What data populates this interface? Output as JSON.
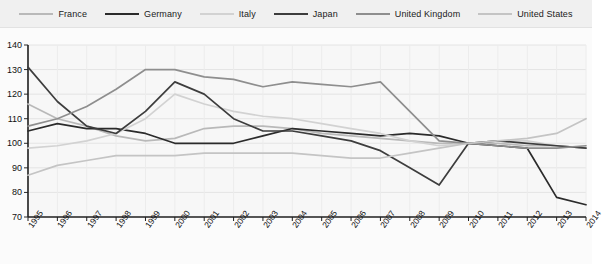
{
  "legend": {
    "position": "top",
    "items": [
      {
        "label": "France",
        "color": "#b9b9b9"
      },
      {
        "label": "Germany",
        "color": "#2b2b2b"
      },
      {
        "label": "Italy",
        "color": "#d2d2d2"
      },
      {
        "label": "Japan",
        "color": "#3d3d3d"
      },
      {
        "label": "United Kingdom",
        "color": "#8e8e8e"
      },
      {
        "label": "United States",
        "color": "#c4c4c4"
      }
    ]
  },
  "axes": {
    "y_ticks": [
      140,
      130,
      120,
      110,
      100,
      90,
      80,
      70
    ],
    "ylim": [
      70,
      140
    ],
    "xlim_labels": [
      "1995",
      "2014"
    ],
    "grid": true
  },
  "source_note": "",
  "chart_data": {
    "type": "line",
    "title": "",
    "subtitle": "",
    "xlabel": "",
    "ylabel": "",
    "ylim": [
      70,
      140
    ],
    "grid": true,
    "legend_position": "top",
    "categories": [
      "1995",
      "1996",
      "1997",
      "1998",
      "1999",
      "2000",
      "2001",
      "2002",
      "2003",
      "2004",
      "2005",
      "2006",
      "2007",
      "2008",
      "2009",
      "2010",
      "2011",
      "2012",
      "2013",
      "2014"
    ],
    "series": [
      {
        "name": "France",
        "color": "#b9b9b9",
        "values": [
          116,
          110,
          107,
          103,
          101,
          102,
          106,
          107,
          107,
          106,
          104,
          103,
          102,
          101,
          100,
          100,
          100,
          99,
          99,
          98
        ]
      },
      {
        "name": "Germany",
        "color": "#2b2b2b",
        "values": [
          105,
          108,
          106,
          106,
          104,
          100,
          100,
          100,
          103,
          106,
          105,
          104,
          103,
          104,
          103,
          100,
          99,
          98,
          78,
          75
        ]
      },
      {
        "name": "Italy",
        "color": "#d2d2d2",
        "values": [
          98,
          99,
          101,
          104,
          110,
          120,
          116,
          113,
          111,
          110,
          108,
          106,
          104,
          101,
          99,
          100,
          101,
          101,
          99,
          98
        ]
      },
      {
        "name": "Japan",
        "color": "#3d3d3d",
        "values": [
          131,
          117,
          107,
          104,
          113,
          125,
          120,
          110,
          105,
          105,
          103,
          101,
          97,
          90,
          83,
          100,
          101,
          100,
          99,
          98
        ]
      },
      {
        "name": "United Kingdom",
        "color": "#8e8e8e",
        "values": [
          107,
          110,
          115,
          122,
          130,
          130,
          127,
          126,
          123,
          125,
          124,
          123,
          125,
          113,
          101,
          100,
          99,
          98,
          98,
          99
        ]
      },
      {
        "name": "United States",
        "color": "#c4c4c4",
        "values": [
          87,
          91,
          93,
          95,
          95,
          95,
          96,
          96,
          96,
          96,
          95,
          94,
          94,
          96,
          98,
          100,
          101,
          102,
          104,
          110
        ]
      }
    ]
  }
}
